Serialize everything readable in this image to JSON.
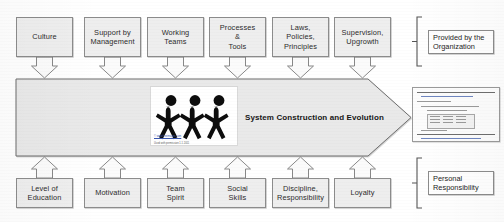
{
  "diagram": {
    "title_text": "System Construction and Evolution",
    "core_arrow_name": "system-construction-and-evolution-arrow",
    "colors": {
      "node_fill": "#eeeeee",
      "node_stroke": "#8c8c8c",
      "arrow_fill": "#e9e9e9",
      "arrow_stroke": "#6f6f6f",
      "connector_fill": "#fbfbfb",
      "connector_stroke": "#7a7a7a",
      "text": "#2b2b2b"
    },
    "top_row": {
      "group_label": "Provided by the\nOrganization",
      "items": [
        {
          "label": "Culture"
        },
        {
          "label": "Support by\nManagement"
        },
        {
          "label": "Working\nTeams"
        },
        {
          "label": "Processes\n&\nTools"
        },
        {
          "label": "Laws,\nPolicies,\nPrinciples"
        },
        {
          "label": "Supervision,\nUpgrowth"
        }
      ]
    },
    "bottom_row": {
      "group_label": "Personal\nResponsibility",
      "items": [
        {
          "label": "Level of\nEducation"
        },
        {
          "label": "Motivation"
        },
        {
          "label": "Team\nSpirit"
        },
        {
          "label": "Social\nSkills"
        },
        {
          "label": "Discipline,\nResponsibility"
        },
        {
          "label": "Loyalty"
        }
      ]
    },
    "people_image": {
      "alt": "three-stick-figures-holding-hands",
      "caption_line1": "© www.freeimages.com",
      "caption_line2": "Used with permission 1.1 2011"
    },
    "document_thumbnail": {
      "alt": "source-code-document-thumbnail"
    }
  }
}
